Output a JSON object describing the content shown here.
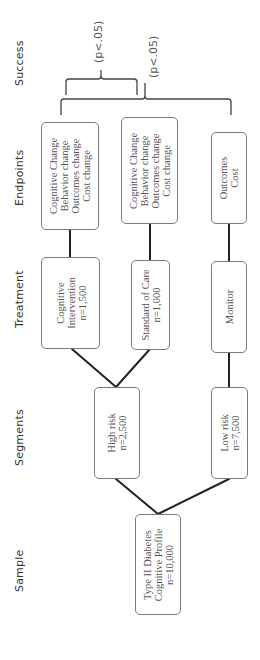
{
  "stages": {
    "success": "Success",
    "endpoints": "Endpoints",
    "treatment": "Treatment",
    "segments": "Segments",
    "sample": "Sample"
  },
  "sample": {
    "lines": [
      "Type II Diabetes",
      "Cognitive Profile",
      "n=10,000"
    ]
  },
  "segments": {
    "high_risk": {
      "lines": [
        "High risk",
        "n=2,500"
      ]
    },
    "low_risk": {
      "lines": [
        "Low risk",
        "n=7,500"
      ]
    }
  },
  "treatment": {
    "cognitive_intervention": {
      "lines": [
        "Cognitive",
        "Intervention",
        "n=1,500"
      ]
    },
    "standard_of_care": {
      "lines": [
        "Standard of Care",
        "n=1,000"
      ]
    },
    "monitor": {
      "lines": [
        "Monitor"
      ]
    }
  },
  "endpoints": {
    "intervention_endpoints": {
      "lines": [
        "Cognitive Change",
        "Behavior change",
        "Outcomes change",
        "Cost change"
      ]
    },
    "standard_endpoints": {
      "lines": [
        "Cognitive Change",
        "Behavior change",
        "Outcomes change",
        "Cost change"
      ]
    },
    "monitor_endpoints": {
      "lines": [
        "Outcomes",
        "Cost"
      ]
    }
  },
  "success": {
    "comparison_1": {
      "label": "(p<.05)"
    },
    "comparison_2": {
      "label": "(p<.05)"
    }
  },
  "colors": {
    "line": "#222222",
    "box_border": "#7a7a7a",
    "text": "#555555",
    "background": "#ffffff"
  }
}
